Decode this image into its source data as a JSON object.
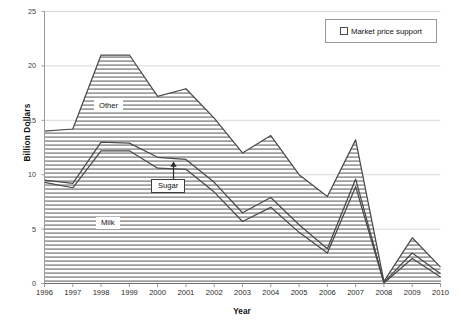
{
  "chart_data": {
    "type": "area",
    "title": "",
    "subtitle": "",
    "xlabel": "Year",
    "ylabel": "Billion Dollars",
    "xlim": [
      1996,
      2010
    ],
    "ylim": [
      0,
      25
    ],
    "yticks": [
      0,
      5,
      10,
      15,
      20,
      25
    ],
    "grid": true,
    "stacked": true,
    "legend_position": "top-right",
    "legend": [
      "Market price support"
    ],
    "categories": [
      1996,
      1997,
      1998,
      1999,
      2000,
      2001,
      2002,
      2003,
      2004,
      2005,
      2006,
      2007,
      2008,
      2009,
      2010
    ],
    "series": [
      {
        "name": "Milk",
        "values": [
          9.3,
          8.8,
          12.2,
          12.2,
          10.6,
          10.5,
          8.4,
          5.7,
          7.0,
          4.7,
          2.8,
          8.9,
          0.05,
          2.3,
          0.6
        ]
      },
      {
        "name": "Sugar",
        "values": [
          0.2,
          0.4,
          0.8,
          0.7,
          1.0,
          0.9,
          0.9,
          0.8,
          0.9,
          0.7,
          0.4,
          0.7,
          0.05,
          0.5,
          0.3
        ]
      },
      {
        "name": "Other",
        "values": [
          4.5,
          5.0,
          8.0,
          8.1,
          5.6,
          6.5,
          5.9,
          5.5,
          5.7,
          4.6,
          4.8,
          3.6,
          0.1,
          1.4,
          0.6
        ]
      }
    ],
    "cumulative_totals": [
      14.0,
      14.2,
      21.0,
      21.0,
      17.2,
      17.9,
      15.2,
      12.0,
      13.6,
      10.0,
      8.0,
      13.2,
      0.2,
      4.2,
      1.5
    ],
    "annotations": [
      {
        "text": "Other",
        "kind": "area-label"
      },
      {
        "text": "Milk",
        "kind": "area-label"
      },
      {
        "text": "Sugar",
        "kind": "callout-with-arrow"
      }
    ],
    "colors": {
      "line": "#4a4a4a",
      "fill_hatch": "#808080",
      "grid": "#d9d9d9",
      "axis": "#9a9a9a",
      "background": "#ffffff"
    }
  },
  "axes": {
    "y_title": "Billion Dollars",
    "x_title": "Year",
    "y_tick_labels": [
      "25",
      "20",
      "15",
      "10",
      "5",
      "0"
    ],
    "x_tick_labels": [
      "1996",
      "1997",
      "1998",
      "1999",
      "2000",
      "2001",
      "2002",
      "2003",
      "2004",
      "2005",
      "2006",
      "2007",
      "2008",
      "2009",
      "2010"
    ]
  },
  "legend": {
    "entries": [
      {
        "label": "Market price support",
        "marker": "square-outline-icon"
      }
    ]
  },
  "labels": {
    "other": "Other",
    "milk": "Milk",
    "sugar": "Sugar"
  }
}
